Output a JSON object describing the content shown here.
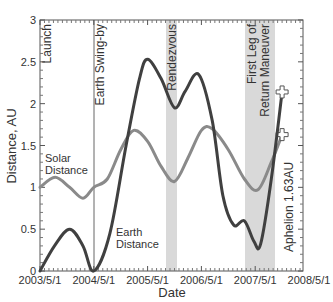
{
  "chart_data": {
    "type": "line",
    "title": "",
    "xlabel": "Date",
    "ylabel": "Distance, AU",
    "ylim": [
      0,
      3
    ],
    "xlim": [
      "2003/5/1",
      "2008/5/1"
    ],
    "x_ticks": [
      "2003/5/1",
      "2004/5/1",
      "2005/5/1",
      "2006/5/1",
      "2007/5/1",
      "2008/5/1"
    ],
    "y_ticks": [
      "0",
      "0.5",
      "1",
      "1.5",
      "2",
      "2.5",
      "3"
    ],
    "grid": false,
    "legend": "inline labels",
    "series": [
      {
        "name": "Earth Distance",
        "color": "#404040",
        "x_years": [
          0.0,
          0.27,
          0.55,
          0.8,
          1.0,
          1.3,
          1.6,
          1.85,
          2.0,
          2.25,
          2.5,
          2.7,
          2.95,
          3.2,
          3.4,
          3.6,
          3.8,
          3.98,
          4.1,
          4.3,
          4.5
        ],
        "values": [
          0.0,
          0.3,
          0.5,
          0.3,
          0.0,
          0.45,
          1.5,
          2.3,
          2.53,
          2.3,
          1.95,
          2.15,
          2.35,
          1.8,
          0.9,
          0.55,
          0.6,
          0.35,
          0.32,
          1.1,
          2.14
        ]
      },
      {
        "name": "Solar Distance",
        "color": "#8a8a8a",
        "x_years": [
          0.0,
          0.28,
          0.55,
          0.8,
          1.0,
          1.25,
          1.5,
          1.74,
          2.0,
          2.25,
          2.5,
          2.75,
          3.0,
          3.2,
          3.5,
          3.8,
          4.05,
          4.3,
          4.5
        ],
        "values": [
          1.0,
          1.12,
          1.0,
          0.87,
          1.0,
          1.1,
          1.45,
          1.68,
          1.55,
          1.25,
          1.07,
          1.35,
          1.68,
          1.7,
          1.45,
          1.1,
          0.97,
          1.3,
          1.63
        ]
      }
    ],
    "annotations": [
      {
        "text": "Launch",
        "x": "2003/5/1",
        "type": "vertical-label"
      },
      {
        "text": "Earth Swing-by",
        "x": "2004/5/1",
        "type": "vertical-line"
      },
      {
        "text": "Rendezvous",
        "x_range": [
          "2005/9/15",
          "2005/11/15"
        ],
        "type": "shaded-band"
      },
      {
        "text": "First Leg of Return Maneuver",
        "x_range": [
          "2007/2/1",
          "2007/8/1"
        ],
        "type": "shaded-band"
      },
      {
        "text": "Aphelion 1.63AU",
        "x": "2007/11/1",
        "type": "end-marker"
      }
    ],
    "inline_labels": {
      "solar": [
        "Solar",
        "Distance"
      ],
      "earth": [
        "Earth",
        "Distance"
      ]
    }
  }
}
